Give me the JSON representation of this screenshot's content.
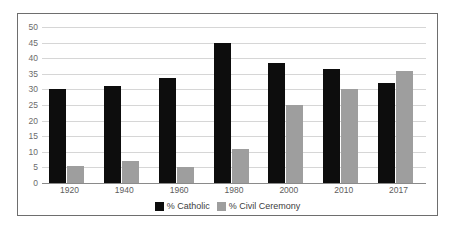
{
  "chart_data": {
    "type": "bar",
    "title": "",
    "xlabel": "",
    "ylabel": "",
    "ylim": [
      0,
      50
    ],
    "ytick_step": 5,
    "grid": true,
    "legend_position": "bottom",
    "categories": [
      "1920",
      "1940",
      "1960",
      "1980",
      "2000",
      "2010",
      "2017"
    ],
    "ytick_labels": [
      "50",
      "45",
      "40",
      "35",
      "30",
      "25",
      "20",
      "15",
      "10",
      "5",
      "0"
    ],
    "series": [
      {
        "name": "% Catholic",
        "color": "#0d0d0d",
        "values": [
          30,
          31,
          33.5,
          45,
          38.5,
          36.5,
          32
        ]
      },
      {
        "name": "% Civil Ceremony",
        "color": "#9e9e9e",
        "values": [
          5.5,
          7,
          5,
          11,
          25,
          30,
          36
        ]
      }
    ]
  },
  "legend": {
    "entries": [
      {
        "label": "% Catholic"
      },
      {
        "label": "% Civil Ceremony"
      }
    ]
  },
  "colors": {
    "catholic": "#0d0d0d",
    "civil": "#9e9e9e",
    "gridline": "#d6d6d6",
    "frame": "#6e6e6e",
    "axis_text": "#5d5d5d"
  }
}
